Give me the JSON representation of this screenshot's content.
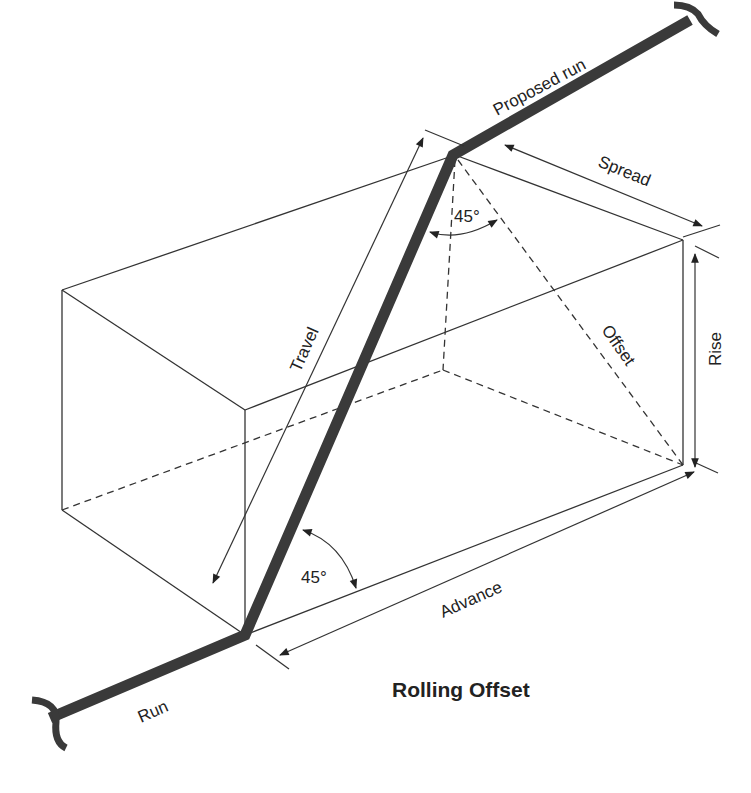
{
  "diagram": {
    "title": "Rolling Offset",
    "labels": {
      "proposed_run": "Proposed run",
      "spread": "Spread",
      "rise": "Rise",
      "offset": "Offset",
      "travel": "Travel",
      "advance": "Advance",
      "run": "Run",
      "angle_top": "45°",
      "angle_bottom": "45°"
    },
    "colors": {
      "pipe": "#3a3a3a",
      "line": "#333333",
      "background": "#ffffff"
    }
  }
}
